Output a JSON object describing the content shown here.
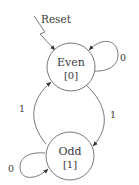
{
  "diagram": {
    "type": "state-machine",
    "reset_label": "Reset",
    "states": [
      {
        "id": "even",
        "name": "Even",
        "output": "[0]",
        "initial": true
      },
      {
        "id": "odd",
        "name": "Odd",
        "output": "[1]",
        "initial": false
      }
    ],
    "transitions": [
      {
        "from": "even",
        "to": "even",
        "label": "0"
      },
      {
        "from": "even",
        "to": "odd",
        "label": "1"
      },
      {
        "from": "odd",
        "to": "even",
        "label": "1"
      },
      {
        "from": "odd",
        "to": "odd",
        "label": "0"
      }
    ],
    "colors": {
      "stroke": "#6a6a6a",
      "text": "#3a3a3a",
      "background": "#ffffff"
    }
  }
}
